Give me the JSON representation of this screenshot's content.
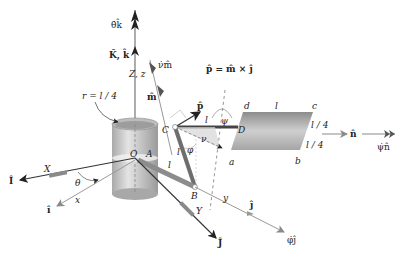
{
  "diagram": {
    "type": "3d-kinematics-mechanism",
    "labels": {
      "theta_dot_k": "θ̇k̂",
      "K_k": "K̂, k̂",
      "Zz": "Z, z",
      "nu_dot_m": "ν̇m̂",
      "m_hat": "m̂",
      "p_formula": "p̂ = m̂ × ĵ",
      "p_hat": "p̂",
      "r": "r = l / 4",
      "C": "C",
      "D": "D",
      "d": "d",
      "c": "c",
      "l_top": "l",
      "l_CD": "l",
      "psi": "ψ",
      "nu": "ν",
      "a": "a",
      "b": "b",
      "l4_top": "l / 4",
      "l4_bottom": "l / 4",
      "n_hat": "n̂",
      "psi_dot_n": "ψ̇n̂",
      "O": "O",
      "A": "A",
      "l_AB": "l",
      "l_CB": "l",
      "phi": "φ",
      "B": "B",
      "X": "X",
      "I_hat": "Î",
      "theta": "θ",
      "x": "x",
      "i_hat": "î",
      "Y": "Y",
      "J_hat": "Ĵ",
      "y": "y",
      "j_hat": "ĵ",
      "phi_dot_j": "φ̇ĵ"
    },
    "colors": {
      "axis_dark": "#222222",
      "axis_gray": "#8a8a8a",
      "cylinder": "#c8c8c8",
      "plate": "#b0b0b0",
      "rod": "#6e6e6e"
    }
  }
}
